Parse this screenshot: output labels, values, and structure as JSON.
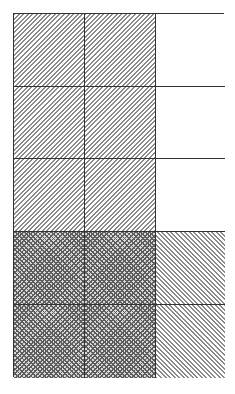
{
  "figure": {
    "type": "fraction-grid-model",
    "columns": 3,
    "rows": 5,
    "border_color": "#333333",
    "fills": {
      "hatch-fwd": {
        "description": "diagonal hatch (/)",
        "color": "#8a8a8a"
      },
      "hatch-back": {
        "description": "diagonal hatch (\\)",
        "color": "#8a8a8a"
      },
      "crosshatch": {
        "description": "cross hatch (dark)",
        "color": "#5e5e5e"
      },
      "empty": {
        "description": "unshaded",
        "color": "#ffffff"
      }
    },
    "cells": [
      [
        "hatch-fwd",
        "hatch-fwd",
        "empty"
      ],
      [
        "hatch-fwd",
        "hatch-fwd",
        "empty"
      ],
      [
        "hatch-fwd",
        "hatch-fwd",
        "empty"
      ],
      [
        "crosshatch",
        "crosshatch",
        "hatch-back"
      ],
      [
        "crosshatch",
        "crosshatch",
        "hatch-back"
      ]
    ],
    "summary": {
      "total_cells": 15,
      "hatch_fwd_cells": 6,
      "crosshatch_cells": 4,
      "hatch_back_cells": 2,
      "empty_cells": 3
    }
  }
}
